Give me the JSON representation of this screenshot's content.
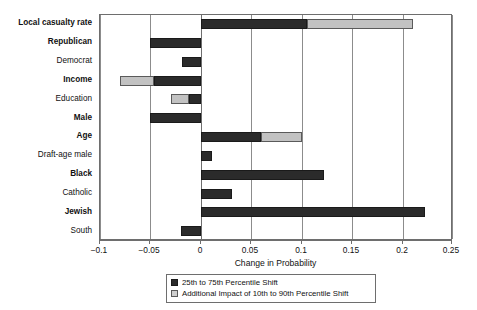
{
  "chart_data": {
    "type": "bar",
    "orientation": "horizontal",
    "title": "",
    "xlabel": "Change in Probability",
    "ylabel": "",
    "xlim": [
      -0.1,
      0.25
    ],
    "xticks": [
      -0.1,
      -0.05,
      0,
      0.05,
      0.1,
      0.15,
      0.2,
      0.25
    ],
    "xticklabels": [
      "−0.1",
      "−0.05",
      "0",
      "0.05",
      "0.1",
      "0.15",
      "0.2",
      "0.25"
    ],
    "grid": "vertical",
    "legend_position": "below-axis-center",
    "stacked": true,
    "colors": {
      "dark": "#2b2b2b",
      "light": "#c2c2c2",
      "frame": "#6e6e6e",
      "gridline": "#8c8c8c",
      "background": "#ffffff",
      "text": "#111111"
    },
    "categories": [
      "Local casualty rate",
      "Republican",
      "Democrat",
      "Income",
      "Education",
      "Male",
      "Age",
      "Draft-age male",
      "Black",
      "Catholic",
      "Jewish",
      "South"
    ],
    "category_styles": [
      "bold",
      "bold",
      "normal",
      "bold",
      "normal",
      "bold",
      "bold",
      "normal",
      "bold",
      "normal",
      "bold",
      "normal"
    ],
    "series": [
      {
        "name": "25th to 75th Percentile Shift",
        "color": "#2b2b2b",
        "values": [
          0.105,
          -0.05,
          -0.019,
          -0.046,
          -0.012,
          -0.05,
          0.06,
          0.011,
          0.122,
          0.031,
          0.222,
          -0.02
        ]
      },
      {
        "name": "Additional Impact of 10th to 90th Percentile Shift",
        "color": "#c2c2c2",
        "values": [
          0.105,
          0.0,
          0.0,
          -0.034,
          -0.018,
          0.0,
          0.04,
          0.0,
          0.0,
          0.0,
          0.0,
          0.0
        ]
      }
    ],
    "bars": [
      {
        "category": "Local casualty rate",
        "dark_start": 0.0,
        "dark_end": 0.105,
        "light_start": 0.105,
        "light_end": 0.21
      },
      {
        "category": "Republican",
        "dark_start": -0.05,
        "dark_end": 0.0,
        "light_start": null,
        "light_end": null
      },
      {
        "category": "Democrat",
        "dark_start": -0.019,
        "dark_end": 0.0,
        "light_start": null,
        "light_end": null
      },
      {
        "category": "Income",
        "dark_start": -0.046,
        "dark_end": 0.0,
        "light_start": -0.08,
        "light_end": -0.046
      },
      {
        "category": "Education",
        "dark_start": -0.012,
        "dark_end": 0.0,
        "light_start": -0.03,
        "light_end": -0.012
      },
      {
        "category": "Male",
        "dark_start": -0.05,
        "dark_end": 0.0,
        "light_start": null,
        "light_end": null
      },
      {
        "category": "Age",
        "dark_start": 0.0,
        "dark_end": 0.06,
        "light_start": 0.06,
        "light_end": 0.1
      },
      {
        "category": "Draft-age male",
        "dark_start": 0.0,
        "dark_end": 0.011,
        "light_start": null,
        "light_end": null
      },
      {
        "category": "Black",
        "dark_start": 0.0,
        "dark_end": 0.122,
        "light_start": null,
        "light_end": null
      },
      {
        "category": "Catholic",
        "dark_start": 0.0,
        "dark_end": 0.031,
        "light_start": null,
        "light_end": null
      },
      {
        "category": "Jewish",
        "dark_start": 0.0,
        "dark_end": 0.222,
        "light_start": null,
        "light_end": null
      },
      {
        "category": "South",
        "dark_start": -0.02,
        "dark_end": 0.0,
        "light_start": null,
        "light_end": null
      }
    ],
    "legend": [
      {
        "label": "25th to 75th Percentile Shift",
        "swatch": "dark"
      },
      {
        "label": "Additional Impact of 10th to 90th Percentile Shift",
        "swatch": "light"
      }
    ]
  }
}
